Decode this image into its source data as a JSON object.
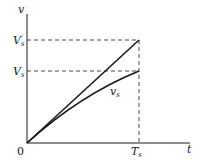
{
  "diagram": {
    "axes": {
      "y_label": "v",
      "x_label": "t",
      "origin_label": "0"
    },
    "labels": {
      "vs_prime": {
        "main": "V",
        "sub": "s",
        "sup": "′"
      },
      "vs": {
        "main": "V",
        "sub": "s"
      },
      "curve": {
        "main": "v",
        "sub": "s"
      },
      "ts": {
        "main": "T",
        "sub": "s"
      }
    },
    "curves": [
      {
        "name": "straight-line",
        "from": [
          0,
          0
        ],
        "to": [
          "T_s",
          "V_s'"
        ],
        "style": "solid"
      },
      {
        "name": "v_s-curve",
        "from": [
          0,
          0
        ],
        "to": [
          "T_s",
          "V_s"
        ],
        "style": "solid, concave"
      }
    ],
    "guides": [
      {
        "name": "V_s' horizontal",
        "style": "dashed"
      },
      {
        "name": "V_s horizontal",
        "style": "dashed"
      },
      {
        "name": "T_s vertical",
        "style": "dashed"
      }
    ],
    "colors": {
      "stroke": "#1a1a1a",
      "background": "#ffffff"
    }
  }
}
